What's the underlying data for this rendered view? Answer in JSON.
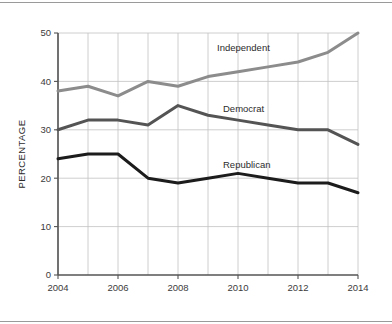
{
  "chart_data": {
    "type": "line",
    "title": "",
    "subtitle": "",
    "xlabel": "",
    "ylabel": "PERCENTAGE",
    "x": [
      2004,
      2005,
      2006,
      2007,
      2008,
      2009,
      2010,
      2011,
      2012,
      2013,
      2014
    ],
    "xlim": [
      2004,
      2014
    ],
    "ylim": [
      0,
      50
    ],
    "xticks": [
      2004,
      2006,
      2008,
      2010,
      2012,
      2014
    ],
    "xtick_labels": [
      "2004",
      "2006",
      "2008",
      "2010",
      "2012",
      "2014"
    ],
    "yticks": [
      0,
      10,
      20,
      30,
      40,
      50
    ],
    "ytick_labels": [
      "0",
      "10",
      "20",
      "30",
      "40",
      "50"
    ],
    "grid": true,
    "grid_x": true,
    "grid_y": true,
    "legend_position": "inline-labels",
    "series": [
      {
        "name": "Independent",
        "color": "#8c8c8c",
        "values": [
          38,
          39,
          37,
          40,
          39,
          41,
          42,
          43,
          44,
          46,
          50
        ],
        "label": "Independent",
        "label_x": 2009.3,
        "label_y": 46.2
      },
      {
        "name": "Democrat",
        "color": "#545454",
        "values": [
          30,
          32,
          32,
          31,
          35,
          33,
          32,
          31,
          30,
          30,
          27
        ],
        "label": "Democrat",
        "label_x": 2009.5,
        "label_y": 33.6
      },
      {
        "name": "Republican",
        "color": "#1c1c1c",
        "values": [
          24,
          25,
          25,
          20,
          19,
          20,
          21,
          20,
          19,
          19,
          17
        ],
        "label": "Republican",
        "label_x": 2009.5,
        "label_y": 22.2
      }
    ]
  },
  "axes": {
    "y_axis_title": "PERCENTAGE"
  },
  "colors": {
    "independent": "#8c8c8c",
    "democrat": "#545454",
    "republican": "#1c1c1c",
    "grid": "#c2c2c2",
    "axis": "#545454",
    "background": "#ffffff"
  }
}
